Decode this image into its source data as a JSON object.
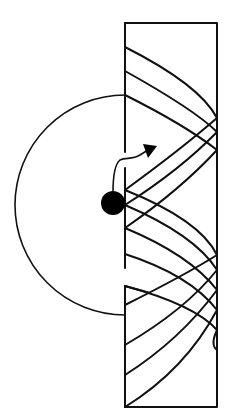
{
  "diagram": {
    "colors": {
      "stroke": "#111111",
      "ball": "#000000",
      "background": "#ffffff"
    },
    "chamber": {
      "x": 125,
      "y": 23,
      "width": 92,
      "height": 384
    },
    "left_wall_segments": [
      {
        "y1": 23,
        "y2": 152
      },
      {
        "y1": 168,
        "y2": 268
      },
      {
        "y1": 286,
        "y2": 407
      }
    ],
    "circle": {
      "cx": 118,
      "cy": 205,
      "r": 110
    },
    "ball": {
      "cx": 113,
      "cy": 203,
      "r": 12
    },
    "arrow": {
      "path": "M113,192 C113,178 114,165 120,160 C126,157 132,160 140,155 L148,150",
      "head": "157,146 143,144 148,158"
    },
    "curves": [
      "M125,47 Q200,85 217,118",
      "M125,71 Q195,110 217,132",
      "M125,95 Q185,125 217,150",
      "M217,118 Q180,150 125,190",
      "M217,132 Q180,170 125,205",
      "M217,150 Q180,190 125,228",
      "M125,190 Q200,220 217,255",
      "M125,205 Q195,235 217,270",
      "M125,228 Q190,255 217,290",
      "M125,286 Q195,305 217,330",
      "M125,254 Q190,275 217,310",
      "M217,255 Q185,275 125,305",
      "M217,270 Q185,310 125,345",
      "M217,290 Q180,340 125,375",
      "M217,310 Q185,370 125,407",
      "M217,330 Q210,345 217,350"
    ]
  }
}
